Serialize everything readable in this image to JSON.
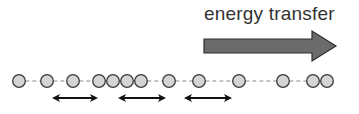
{
  "title": "energy transfer",
  "colors": {
    "arrow_fill": "#6b6b6b",
    "arrow_stroke": "#2e2e2e",
    "circle_fill": "#d4d4d4",
    "circle_stroke": "#3a3a3a",
    "dash": "#8a8a8a",
    "double_arrow": "#111111"
  },
  "chain": {
    "y": 81,
    "radius": 6.3,
    "circles_x": [
      19,
      47,
      73,
      99,
      113,
      127,
      141,
      169,
      199,
      239,
      283,
      313,
      327
    ]
  },
  "double_arrows": [
    {
      "x1": 52,
      "x2": 98,
      "y": 98
    },
    {
      "x1": 118,
      "x2": 166,
      "y": 98
    },
    {
      "x1": 184,
      "x2": 232,
      "y": 98
    }
  ],
  "big_arrow": {
    "x_start": 204,
    "x_shaft_end": 312,
    "x_tip": 336,
    "y_mid": 46,
    "shaft_half": 7,
    "head_half": 15
  }
}
